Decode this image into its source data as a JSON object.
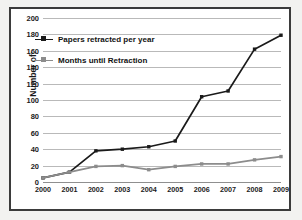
{
  "chart_data": {
    "type": "line",
    "title": "",
    "xlabel": "",
    "ylabel": "Number of:",
    "categories": [
      "2000",
      "2001",
      "2002",
      "2003",
      "2004",
      "2005",
      "2006",
      "2007",
      "2008",
      "2009"
    ],
    "ylim": [
      0,
      200
    ],
    "y_ticks": [
      0,
      20,
      40,
      60,
      80,
      100,
      120,
      140,
      160,
      180,
      200
    ],
    "grid": true,
    "legend_position": "upper-left",
    "series": [
      {
        "name": "Papers retracted per year",
        "color": "#1a1a1a",
        "marker": "square",
        "values": [
          5,
          12,
          38,
          40,
          43,
          50,
          104,
          111,
          162,
          179
        ]
      },
      {
        "name": "Months until Retraction",
        "color": "#8c8c8c",
        "marker": "square",
        "values": [
          5,
          12,
          19,
          20,
          15,
          19,
          22,
          22,
          27,
          31
        ]
      }
    ]
  },
  "axis": {
    "y_title": "Number of:"
  },
  "legend": {
    "items": [
      {
        "label": "Papers retracted per year",
        "color": "#1a1a1a"
      },
      {
        "label": "Months until Retraction",
        "color": "#8c8c8c"
      }
    ]
  }
}
